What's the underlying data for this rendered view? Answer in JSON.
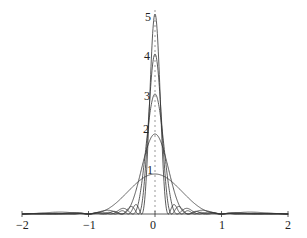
{
  "chart_data": {
    "type": "line",
    "title": "",
    "xlabel": "",
    "ylabel": "",
    "xlim": [
      -2,
      2
    ],
    "ylim": [
      0,
      5
    ],
    "grid": false,
    "legend": "none",
    "x_ticks": [
      "-2",
      "-1",
      "0",
      "1",
      "2"
    ],
    "y_ticks": [
      "1",
      "2",
      "3",
      "4",
      "5"
    ],
    "series": [
      {
        "name": "n=1",
        "peak": 1,
        "zeros": [
          -2,
          -1,
          1,
          2
        ]
      },
      {
        "name": "n=2",
        "peak": 2,
        "zeros": [
          -1,
          -0.5,
          0.5,
          1
        ]
      },
      {
        "name": "n=3",
        "peak": 3,
        "zeros": [
          -0.667,
          -0.333,
          0.333,
          0.667
        ]
      },
      {
        "name": "n=4",
        "peak": 4,
        "zeros": [
          -0.5,
          -0.25,
          0.25,
          0.5
        ]
      },
      {
        "name": "n=5",
        "peak": 5,
        "zeros": [
          -0.4,
          -0.2,
          0.2,
          0.4
        ]
      }
    ],
    "line_color": "#333333"
  },
  "axes": {
    "x_labels": [
      "−2",
      "−1",
      "0",
      "1",
      "2"
    ],
    "y_labels": [
      "1",
      "2",
      "3",
      "4",
      "5"
    ]
  }
}
